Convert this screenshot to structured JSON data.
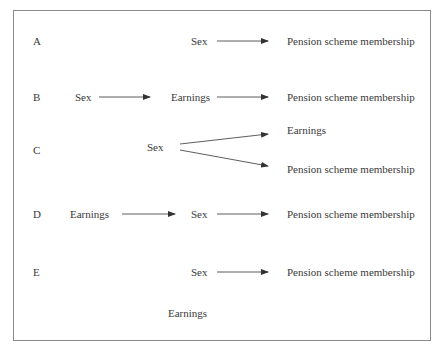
{
  "diagram": {
    "rows": [
      {
        "label": "A",
        "nodes": [
          "Sex",
          "Pension scheme membership"
        ],
        "edges": [
          [
            "Sex",
            "Pension scheme membership"
          ]
        ]
      },
      {
        "label": "B",
        "nodes": [
          "Sex",
          "Earnings",
          "Pension scheme membership"
        ],
        "edges": [
          [
            "Sex",
            "Earnings"
          ],
          [
            "Earnings",
            "Pension scheme membership"
          ]
        ]
      },
      {
        "label": "C",
        "nodes": [
          "Sex",
          "Earnings",
          "Pension scheme membership"
        ],
        "edges": [
          [
            "Sex",
            "Earnings"
          ],
          [
            "Sex",
            "Pension scheme membership"
          ]
        ]
      },
      {
        "label": "D",
        "nodes": [
          "Earnings",
          "Sex",
          "Pension scheme membership"
        ],
        "edges": [
          [
            "Earnings",
            "Sex"
          ],
          [
            "Sex",
            "Pension scheme membership"
          ]
        ]
      },
      {
        "label": "E",
        "nodes": [
          "Sex",
          "Pension scheme membership",
          "Earnings"
        ],
        "edges": [
          [
            "Sex",
            "Pension scheme membership"
          ]
        ]
      }
    ],
    "text": {
      "a_label": "A",
      "a_sex": "Sex",
      "a_pension": "Pension scheme membership",
      "b_label": "B",
      "b_sex": "Sex",
      "b_earnings": "Earnings",
      "b_pension": "Pension scheme membership",
      "c_label": "C",
      "c_sex": "Sex",
      "c_earnings": "Earnings",
      "c_pension": "Pension scheme membership",
      "d_label": "D",
      "d_earnings": "Earnings",
      "d_sex": "Sex",
      "d_pension": "Pension scheme membership",
      "e_label": "E",
      "e_sex": "Sex",
      "e_pension": "Pension scheme membership",
      "e_earnings": "Earnings"
    },
    "colors": {
      "border": "#8a8a8a",
      "text": "#3a3a3a",
      "arrow": "#333333"
    }
  }
}
